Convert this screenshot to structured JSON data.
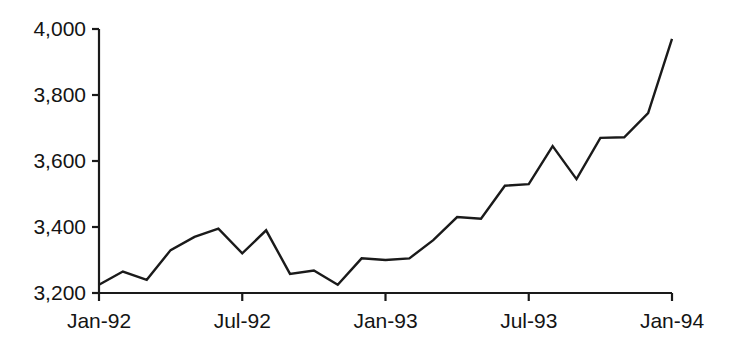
{
  "chart_data": {
    "type": "line",
    "title": "",
    "subtitle": "",
    "xlabel": "",
    "ylabel": "",
    "grid": false,
    "legend": false,
    "legend_position": "none",
    "line_color": "#1a1a1a",
    "background_color": "#ffffff",
    "axis_color": "#1a1a1a",
    "ylim": [
      3200,
      4000
    ],
    "y_ticks": [
      3200,
      3400,
      3600,
      3800,
      4000
    ],
    "y_tick_labels": [
      "3,200",
      "3,400",
      "3,600",
      "3,800",
      "4,000"
    ],
    "x_ticks": [
      "Jan-92",
      "Jul-92",
      "Jan-93",
      "Jul-93",
      "Jan-94"
    ],
    "x_tick_labels": [
      "Jan-92",
      "Jul-92",
      "Jan-93",
      "Jul-93",
      "Jan-94"
    ],
    "xlim": [
      "Jan-92",
      "Jan-94"
    ],
    "categories": [
      "Jan-92",
      "Feb-92",
      "Mar-92",
      "Apr-92",
      "May-92",
      "Jun-92",
      "Jul-92",
      "Aug-92",
      "Sep-92",
      "Oct-92",
      "Nov-92",
      "Dec-92",
      "Jan-93",
      "Feb-93",
      "Mar-93",
      "Apr-93",
      "May-93",
      "Jun-93",
      "Jul-93",
      "Aug-93",
      "Sep-93",
      "Oct-93",
      "Nov-93",
      "Dec-93",
      "Jan-94"
    ],
    "values": [
      3225,
      3265,
      3240,
      3330,
      3370,
      3395,
      3320,
      3390,
      3258,
      3268,
      3225,
      3305,
      3300,
      3305,
      3360,
      3430,
      3425,
      3525,
      3530,
      3645,
      3545,
      3670,
      3672,
      3745,
      3970
    ]
  }
}
